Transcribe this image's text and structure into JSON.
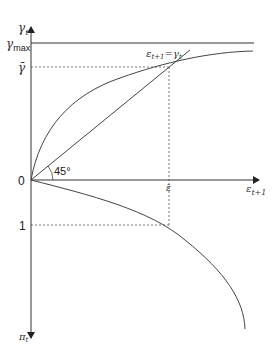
{
  "diagram": {
    "y_axis_top_label": "γ",
    "y_axis_top_sub": "t",
    "y_axis_bottom_label": "π",
    "y_axis_bottom_sub": "t",
    "x_axis_label": "ε",
    "x_axis_sub": "t+1",
    "gamma_max_label": "γ",
    "gamma_max_sub": "max",
    "gamma_bar_label": "γ̄",
    "origin_label": "0",
    "one_label": "1",
    "eps_bar_label": "ε̄",
    "angle_label": "45°",
    "line_label_lhs": "ε",
    "line_label_lhs_sub": "t+1",
    "line_label_eq": "=",
    "line_label_rhs": "γ",
    "line_label_rhs_sub": "t",
    "colors": {
      "axis": "#333333",
      "curve": "#444444",
      "dashed": "#555555"
    }
  }
}
